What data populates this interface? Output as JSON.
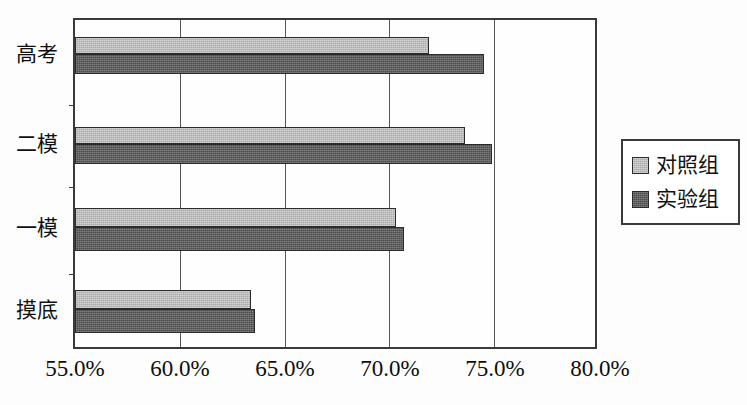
{
  "chart_data": {
    "type": "bar",
    "orientation": "horizontal",
    "title": "",
    "xlabel": "",
    "ylabel": "",
    "categories": [
      "摸底",
      "一模",
      "二模",
      "高考"
    ],
    "categories_top_to_bottom": [
      "高考",
      "二模",
      "一模",
      "摸底"
    ],
    "series": [
      {
        "name": "对照组",
        "color": "#ababab",
        "values": [
          63.4,
          70.3,
          73.6,
          71.9
        ]
      },
      {
        "name": "实验组",
        "color": "#4b4b4b",
        "values": [
          63.6,
          70.7,
          74.9,
          74.5
        ]
      }
    ],
    "xlim": [
      55.0,
      80.0
    ],
    "xticks": [
      55.0,
      60.0,
      65.0,
      70.0,
      75.0,
      80.0
    ],
    "xtick_labels": [
      "55.0%",
      "60.0%",
      "65.0%",
      "70.0%",
      "75.0%",
      "80.0%"
    ],
    "grid": true,
    "grid_axis": "x",
    "legend_position": "right"
  },
  "legend": {
    "entries": [
      {
        "label": "对照组",
        "color": "#ababab"
      },
      {
        "label": "实验组",
        "color": "#4b4b4b"
      }
    ]
  },
  "axis": {
    "x_labels": [
      "55.0%",
      "60.0%",
      "65.0%",
      "70.0%",
      "75.0%",
      "80.0%"
    ],
    "y_labels": [
      "高考",
      "二模",
      "一模",
      "摸底"
    ]
  },
  "colors": {
    "control_group": "#ababab",
    "experiment_group": "#4b4b4b",
    "axis": "#3a3a3a",
    "grid": "#555555",
    "background": "#ffffff"
  }
}
